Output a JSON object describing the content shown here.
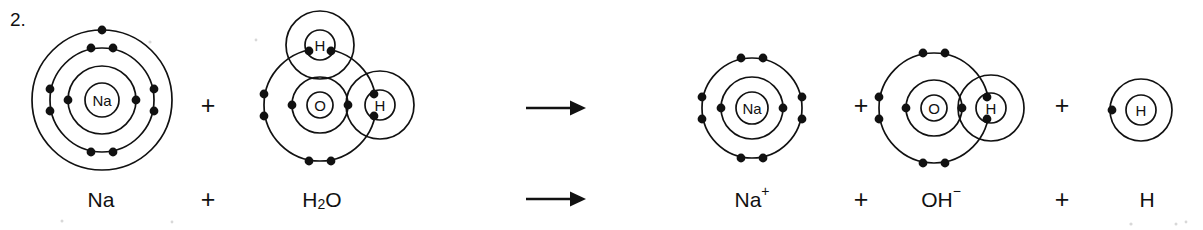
{
  "question": {
    "number": "2."
  },
  "operators": {
    "plus": "+",
    "arrow": "→"
  },
  "diagram": {
    "reactants": [
      {
        "id": "sodium-atom",
        "label": "Na",
        "cx": 102,
        "cy": 100,
        "nucleus_r": 17,
        "shells": [
          {
            "r": 34,
            "electrons": 2,
            "start_angle": 0,
            "arrangement": "axial-lr"
          },
          {
            "r": 52,
            "electrons": 8,
            "arrangement": "paired-4"
          },
          {
            "r": 70,
            "electrons": 1,
            "arrangement": "top-single"
          }
        ]
      },
      {
        "id": "water-molecule",
        "label": "O",
        "cx": 320,
        "cy": 105,
        "nucleus_r": 13,
        "shells": [
          {
            "r": 28,
            "electrons": 2,
            "arrangement": "axial-lr"
          },
          {
            "r": 56,
            "electrons": 4,
            "arrangement": "lone-pairs-water"
          }
        ],
        "bonded_hydrogens": [
          {
            "id": "water-h-top",
            "label": "H",
            "cx": 320,
            "cy": 45,
            "nucleus_r": 15,
            "shell_r": 34,
            "pair_angle": 90
          },
          {
            "id": "water-h-right",
            "label": "H",
            "cx": 380,
            "cy": 105,
            "nucleus_r": 15,
            "shell_r": 34,
            "pair_angle": 0
          }
        ]
      }
    ],
    "arrow": {
      "x1": 526,
      "x2": 586,
      "y": 108
    },
    "products": [
      {
        "id": "sodium-ion",
        "label": "Na",
        "cx": 752,
        "cy": 108,
        "nucleus_r": 16,
        "shells": [
          {
            "r": 31,
            "electrons": 2,
            "arrangement": "axial-lr"
          },
          {
            "r": 50,
            "electrons": 8,
            "arrangement": "paired-4"
          }
        ]
      },
      {
        "id": "hydroxide-ion",
        "label": "O",
        "cx": 934,
        "cy": 108,
        "nucleus_r": 13,
        "shells": [
          {
            "r": 28,
            "electrons": 2,
            "arrangement": "axial-lr"
          },
          {
            "r": 55,
            "electrons": 6,
            "arrangement": "lone-pairs-hydroxide"
          }
        ],
        "bonded_hydrogens": [
          {
            "id": "hydroxide-h",
            "label": "H",
            "cx": 991,
            "cy": 108,
            "nucleus_r": 15,
            "shell_r": 33,
            "pair_angle": 0
          }
        ]
      },
      {
        "id": "hydrogen-atom",
        "label": "H",
        "cx": 1141,
        "cy": 110,
        "nucleus_r": 15,
        "shells": [
          {
            "r": 31,
            "electrons": 1,
            "arrangement": "left-single"
          }
        ]
      }
    ],
    "operator_positions": [
      {
        "id": "diagram-plus-1",
        "x": 208,
        "y": 105
      },
      {
        "id": "diagram-plus-2",
        "x": 861,
        "y": 105
      },
      {
        "id": "diagram-plus-3",
        "x": 1062,
        "y": 105
      }
    ]
  },
  "equation": {
    "y": 199,
    "terms": [
      {
        "id": "equation-term-na",
        "kind": "formula",
        "x": 101,
        "base": "Na",
        "sub": "",
        "sup": ""
      },
      {
        "id": "equation-plus-1",
        "kind": "operator",
        "x": 208,
        "base": "+"
      },
      {
        "id": "equation-term-water",
        "kind": "formula",
        "x": 322,
        "base": "H",
        "sub": "2",
        "base2": "O",
        "sup": ""
      },
      {
        "id": "equation-arrow",
        "kind": "arrow",
        "x1": 526,
        "x2": 586
      },
      {
        "id": "equation-term-sodium-ion",
        "kind": "formula",
        "x": 752,
        "base": "Na",
        "sub": "",
        "sup": "+"
      },
      {
        "id": "equation-plus-2",
        "kind": "operator",
        "x": 861,
        "base": "+"
      },
      {
        "id": "equation-term-hydroxide",
        "kind": "formula",
        "x": 941,
        "base": "OH",
        "sub": "",
        "sup": "−"
      },
      {
        "id": "equation-plus-3",
        "kind": "operator",
        "x": 1062,
        "base": "+"
      },
      {
        "id": "equation-term-hydrogen",
        "kind": "formula",
        "x": 1147,
        "base": "H",
        "sub": "",
        "sup": ""
      }
    ]
  },
  "colors": {
    "ink": "#111111",
    "background": "#ffffff"
  }
}
